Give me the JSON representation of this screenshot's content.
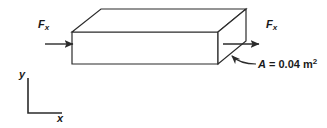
{
  "figure": {
    "name": "axial-force-block-diagram",
    "background_color": "#ffffff",
    "line_color": "#2b2b2b",
    "text_color": "#1a1a1a"
  },
  "labels": {
    "force_left": {
      "symbol": "F",
      "subscript": "x"
    },
    "force_right": {
      "symbol": "F",
      "subscript": "x"
    },
    "area": {
      "symbol": "A",
      "equals": " = ",
      "value": "0.04",
      "unit": "m",
      "exponent": "2"
    },
    "axis_y": "y",
    "axis_x": "x"
  },
  "geometry": {
    "block": {
      "front_face": [
        [
          72,
          32
        ],
        [
          218,
          32
        ],
        [
          218,
          64
        ],
        [
          72,
          64
        ]
      ],
      "top_face": [
        [
          72,
          32
        ],
        [
          101,
          9
        ],
        [
          246,
          9
        ],
        [
          218,
          32
        ]
      ],
      "right_face": [
        [
          218,
          32
        ],
        [
          246,
          9
        ],
        [
          246,
          41
        ],
        [
          218,
          64
        ]
      ]
    },
    "arrow_left": {
      "from": [
        73,
        44
      ],
      "to": [
        36,
        44
      ],
      "direction": "left"
    },
    "arrow_right": {
      "from": [
        223,
        44
      ],
      "to": [
        268,
        44
      ],
      "direction": "right"
    },
    "axes": {
      "origin": [
        28,
        113
      ],
      "y_top": [
        28,
        78
      ],
      "x_right": [
        62,
        113
      ]
    },
    "leader": {
      "tip": [
        226,
        50
      ],
      "curve_end": [
        256,
        64
      ]
    }
  }
}
